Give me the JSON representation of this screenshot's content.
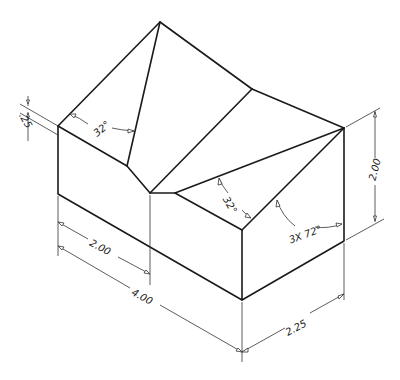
{
  "drawing": {
    "title": "Isometric view of block with V-notch roof",
    "units": "inches",
    "colors": {
      "line": "#1a1a1a",
      "dimension": "#333333",
      "background": "#ffffff"
    }
  },
  "dimensions": {
    "chamfer_depth": ".25",
    "left_angle": "32°",
    "right_angle": "32°",
    "repeat_angle": "3X  72°",
    "height": "2.00",
    "half_length": "2.00",
    "length": "4.00",
    "width": "2.25"
  }
}
